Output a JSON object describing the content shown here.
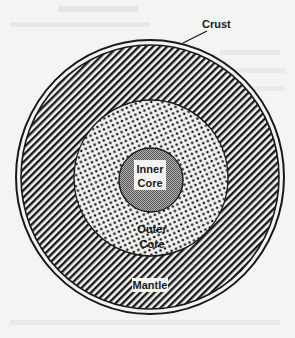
{
  "diagram": {
    "type": "concentric-layers",
    "layers": [
      {
        "id": "crust",
        "label": "Crust",
        "pattern": "solid-ring"
      },
      {
        "id": "mantle",
        "label": "Mantle",
        "pattern": "diagonal-hatch"
      },
      {
        "id": "outer_core",
        "label_line1": "Outer",
        "label_line2": "Core",
        "pattern": "dots"
      },
      {
        "id": "inner_core",
        "label_line1": "Inner",
        "label_line2": "Core",
        "pattern": "gray-checker"
      }
    ],
    "labels": {
      "crust": "Crust",
      "mantle": "Mantle",
      "outer_core_1": "Outer",
      "outer_core_2": "Core",
      "inner_core_1": "Inner",
      "inner_core_2": "Core"
    },
    "colors": {
      "background": "#f4f4f2",
      "ink": "#1a1a1a",
      "inner_core_fill": "#8a8a8a"
    }
  }
}
